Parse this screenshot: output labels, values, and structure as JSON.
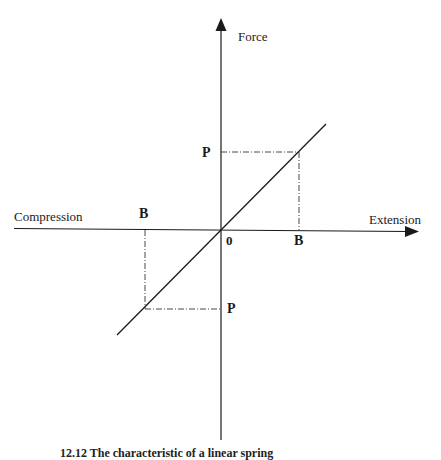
{
  "diagram": {
    "type": "force-extension graph",
    "axes": {
      "vertical_label": "Force",
      "horizontal_left_label": "Compression",
      "horizontal_right_label": "Extension",
      "origin_label": "0"
    },
    "points": {
      "upper_force_label": "P",
      "upper_extension_label": "B",
      "lower_force_label": "P",
      "lower_compression_label": "B"
    },
    "caption": "12.12   The characteristic of a linear spring"
  },
  "colors": {
    "line": "#1a1a1a",
    "background": "#ffffff"
  }
}
